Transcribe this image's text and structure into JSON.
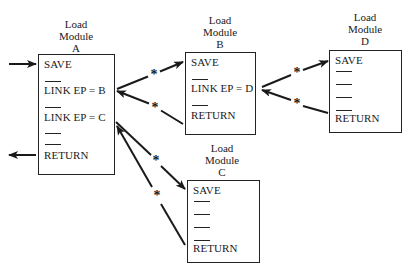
{
  "diagram": {
    "title": "",
    "modules": [
      {
        "id": "A",
        "label_lines": [
          "Load",
          "Module",
          "A"
        ],
        "lines": [
          {
            "type": "text",
            "text": "SAVE"
          },
          {
            "type": "dash"
          },
          {
            "type": "text",
            "text": "LINK EP = B"
          },
          {
            "type": "dash"
          },
          {
            "type": "text",
            "text": "LINK EP = C"
          },
          {
            "type": "dash"
          },
          {
            "type": "dash"
          },
          {
            "type": "text",
            "text": "RETURN"
          }
        ]
      },
      {
        "id": "B",
        "label_lines": [
          "Load",
          "Module",
          "B"
        ],
        "lines": [
          {
            "type": "text",
            "text": "SAVE"
          },
          {
            "type": "dash"
          },
          {
            "type": "text",
            "text": "LINK EP = D"
          },
          {
            "type": "dash"
          },
          {
            "type": "text",
            "text": "RETURN"
          }
        ]
      },
      {
        "id": "C",
        "label_lines": [
          "Load",
          "Module",
          "C"
        ],
        "lines": [
          {
            "type": "text",
            "text": "SAVE"
          },
          {
            "type": "dash"
          },
          {
            "type": "dash"
          },
          {
            "type": "dash"
          },
          {
            "type": "dash"
          },
          {
            "type": "text",
            "text": "RETURN"
          }
        ]
      },
      {
        "id": "D",
        "label_lines": [
          "Load",
          "Module",
          "D"
        ],
        "lines": [
          {
            "type": "text",
            "text": "SAVE"
          },
          {
            "type": "dash"
          },
          {
            "type": "dash"
          },
          {
            "type": "dash"
          },
          {
            "type": "dash"
          },
          {
            "type": "text",
            "text": "RETURN"
          }
        ]
      }
    ],
    "edges": [
      {
        "from": "external",
        "to": "A.SAVE",
        "label": ""
      },
      {
        "from": "A.RETURN",
        "to": "external",
        "label": ""
      },
      {
        "from": "A.LINK EP = B",
        "to": "B.SAVE",
        "label": "*"
      },
      {
        "from": "B.RETURN",
        "to": "A.LINK EP = B",
        "label": "*"
      },
      {
        "from": "A.LINK EP = C",
        "to": "C.SAVE",
        "label": "*"
      },
      {
        "from": "C.RETURN",
        "to": "A.LINK EP = C",
        "label": "*"
      },
      {
        "from": "B.LINK EP = D",
        "to": "D.SAVE",
        "label": "*"
      },
      {
        "from": "D.RETURN",
        "to": "B.LINK EP = D",
        "label": "*"
      }
    ],
    "edge_marker": "*",
    "colors": {
      "ink": "#1a1a1a",
      "background": "#ffffff"
    }
  }
}
